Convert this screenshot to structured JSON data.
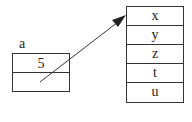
{
  "variable": {
    "label": "a",
    "cells": [
      "5",
      ""
    ]
  },
  "array": {
    "cells": [
      "x",
      "y",
      "z",
      "t",
      "u"
    ]
  },
  "colors": {
    "stroke": "#333333",
    "background": "#ffffff"
  }
}
